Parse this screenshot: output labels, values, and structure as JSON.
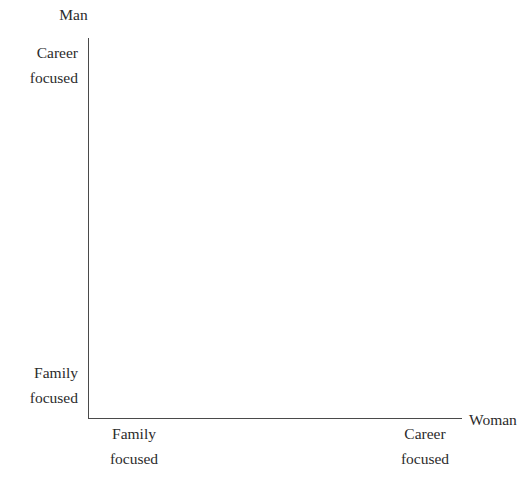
{
  "chart_data": {
    "type": "scatter",
    "title": "",
    "subtitle": "",
    "xlabel": "Woman",
    "ylabel": "Man",
    "x_axis": {
      "name": "Woman",
      "low_label": "Family\nfocused",
      "high_label": "Career\nfocused",
      "ticks": [],
      "grid": false
    },
    "y_axis": {
      "name": "Man",
      "low_label": "Family\nfocused",
      "high_label": "Career\nfocused",
      "ticks": [],
      "grid": false
    },
    "series": [],
    "annotations": [],
    "legend": null
  },
  "axes": {
    "y_title": "Man",
    "y_high": "Career\nfocused",
    "y_low": "Family\nfocused",
    "x_title": "Woman",
    "x_low": "Family\nfocused",
    "x_high": "Career\nfocused"
  },
  "colors": {
    "background": "#ffffff",
    "axis_line": "#4a4a4a",
    "text": "#2b2b2b"
  }
}
